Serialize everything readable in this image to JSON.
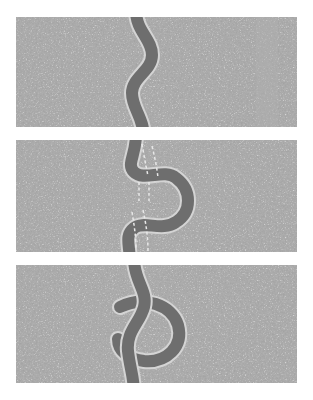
{
  "figure": {
    "title": "",
    "type": "three-panel-sequence-diagram",
    "panel_count": 3,
    "background_color": "#ffffff"
  },
  "palette": {
    "terrain_base": "#a0a0a0",
    "terrain_speckle": "#c2c2c2",
    "terrain_streak": "#b0b0b0",
    "river_fill": "#6e6e6e",
    "river_bank": "#d4d4d4",
    "dashed_guide": "#e8e8e8"
  },
  "geometry": {
    "canvas": {
      "width": 313,
      "height": 400
    },
    "panel_left": 16,
    "panel_width": 281,
    "panels": [
      {
        "id": "panel-1",
        "top": 17,
        "height": 110
      },
      {
        "id": "panel-2",
        "top": 140,
        "height": 112
      },
      {
        "id": "panel-3",
        "top": 265,
        "height": 118
      }
    ],
    "river_width": 12,
    "bank_width": 15
  },
  "panels": [
    {
      "id": "panel-1",
      "label": "stage-1-gentle-meander",
      "caption": "",
      "river_path": "M 120 -6 C 120 14, 136 22, 136 38 C 136 54, 116 60, 116 76 C 116 92, 128 100, 128 122",
      "dashed_guides": [],
      "has_streak": true,
      "streak_x": 250
    },
    {
      "id": "panel-2",
      "label": "stage-2-pronounced-meander-neck",
      "caption": "",
      "river_path": "M 120 -6 C 120 16, 110 24, 118 32 C 128 42, 148 28, 160 38 C 176 50, 176 72, 160 82 C 146 92, 128 80, 118 88 C 108 96, 114 104, 114 124",
      "dashed_guides": [
        "M 126 8 C 128 18, 130 26, 132 34",
        "M 136 10 C 139 20, 141 28, 142 36",
        "M 124 44 C 124 50, 124 54, 124 60",
        "M 134 44 C 134 50, 134 54, 134 60",
        "M 118 74 C 120 84, 122 94, 122 108",
        "M 128 72 C 131 84, 133 96, 133 110"
      ],
      "has_streak": false,
      "streak_x": 0
    },
    {
      "id": "panel-3",
      "label": "stage-3-oxbow-lake-cutoff",
      "caption": "",
      "river_path": "M 118 -6 C 118 16, 132 26, 128 42 C 124 58, 110 66, 112 86 C 114 104, 118 112, 118 128",
      "oxbow_path": "M 104 46 C 126 36, 152 44, 158 62 C 164 82, 148 96, 128 94 C 114 92, 106 84, 106 74",
      "dashed_guides": [],
      "has_streak": false,
      "streak_x": 0
    }
  ]
}
